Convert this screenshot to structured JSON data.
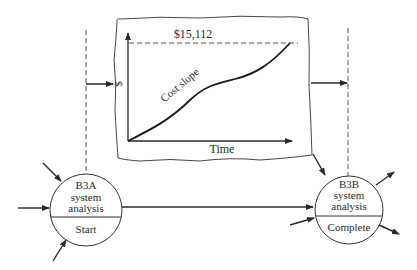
{
  "diagram": {
    "chart_box": {
      "value_label": "$15,112",
      "y_axis_label": "$",
      "x_axis_label": "Time",
      "curve_label": "Cost slope"
    },
    "nodes": [
      {
        "id": "B3A",
        "line1": "B3A",
        "line2": "system",
        "line3": "analysis",
        "lower": "Start"
      },
      {
        "id": "B3B",
        "line1": "B3B",
        "line2": "system",
        "line3": "analysis",
        "lower": "Complete"
      }
    ],
    "colors": {
      "stroke": "#2a2a2a",
      "dashed": "#555555",
      "background": "#ffffff"
    }
  }
}
